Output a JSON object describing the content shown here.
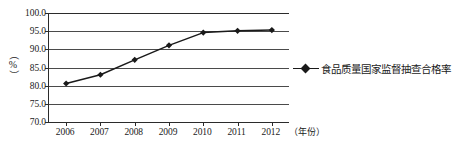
{
  "chart_data": {
    "type": "line",
    "title": "",
    "xlabel": "（年份）",
    "ylabel": "（%）",
    "categories": [
      "2006",
      "2007",
      "2008",
      "2009",
      "2010",
      "2011",
      "2012"
    ],
    "series": [
      {
        "name": "食品质量国家监督抽查合格率",
        "values": [
          80.6,
          83.0,
          87.1,
          91.1,
          94.6,
          95.1,
          95.3
        ]
      }
    ],
    "ylim": [
      70.0,
      100.0
    ],
    "y_ticks": [
      "100.0",
      "95.0",
      "90.0",
      "85.0",
      "80.0",
      "75.0",
      "70.0"
    ],
    "y_tick_values": [
      100.0,
      95.0,
      90.0,
      85.0,
      80.0,
      75.0,
      70.0
    ],
    "grid": true,
    "legend_position": "right",
    "marker": "diamond",
    "line_color": "#1a1a1a",
    "grid_color": "#4a4a4a",
    "axis_color": "#2b2b2b"
  },
  "legend": {
    "entries": [
      {
        "label": "食品质量国家监督抽查合格率"
      }
    ]
  },
  "axes": {
    "y_title_paren_open": "（",
    "y_title_symbol": "%",
    "y_title_paren_close": "）",
    "x_title": "（年份）"
  }
}
